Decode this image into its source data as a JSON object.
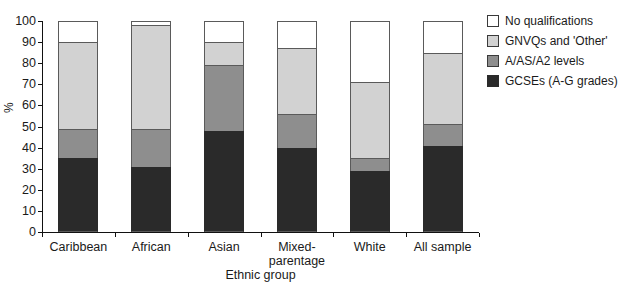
{
  "chart_data": {
    "type": "bar",
    "stacked": true,
    "title": "",
    "xlabel": "Ethnic group",
    "ylabel": "%",
    "ylim": [
      0,
      100
    ],
    "yticks": [
      0,
      10,
      20,
      30,
      40,
      50,
      60,
      70,
      80,
      90,
      100
    ],
    "grid": false,
    "legend_position": "right",
    "categories": [
      "Caribbean",
      "African",
      "Asian",
      "Mixed-parentage",
      "White",
      "All sample"
    ],
    "series": [
      {
        "name": "GCSEs (A-G grades)",
        "color": "#2a2a2a",
        "values": [
          35,
          31,
          48,
          40,
          29,
          41
        ]
      },
      {
        "name": "A/AS/A2 levels",
        "color": "#8e8e8e",
        "values": [
          14,
          18,
          31,
          16,
          6,
          10
        ]
      },
      {
        "name": "GNVQs and 'Other'",
        "color": "#d2d2d2",
        "values": [
          41,
          49,
          11,
          31,
          36,
          34
        ]
      },
      {
        "name": "No qualifications",
        "color": "#ffffff",
        "values": [
          10,
          2,
          10,
          13,
          29,
          15
        ]
      }
    ],
    "stack_order_bottom_to_top": [
      "GCSEs (A-G grades)",
      "A/AS/A2 levels",
      "GNVQs and 'Other'",
      "No qualifications"
    ]
  },
  "axes": {
    "y_title": "%",
    "x_title": "Ethnic group",
    "y_tick_labels": [
      "100",
      "90",
      "80",
      "70",
      "60",
      "50",
      "40",
      "30",
      "20",
      "10",
      "0"
    ],
    "x_tick_labels": [
      "Caribbean",
      "African",
      "Asian",
      "Mixed-\nparentage",
      "White",
      "All sample"
    ]
  },
  "x_labels": [
    {
      "line1": "Caribbean",
      "line2": ""
    },
    {
      "line1": "African",
      "line2": ""
    },
    {
      "line1": "Asian",
      "line2": ""
    },
    {
      "line1": "Mixed-",
      "line2": "parentage"
    },
    {
      "line1": "White",
      "line2": ""
    },
    {
      "line1": "All sample",
      "line2": ""
    }
  ],
  "legend": {
    "items": [
      {
        "label": "No qualifications",
        "color": "#ffffff"
      },
      {
        "label": "GNVQs and 'Other'",
        "color": "#d2d2d2"
      },
      {
        "label": "A/AS/A2 levels",
        "color": "#8e8e8e"
      },
      {
        "label": "GCSEs (A-G grades)",
        "color": "#2a2a2a"
      }
    ]
  }
}
